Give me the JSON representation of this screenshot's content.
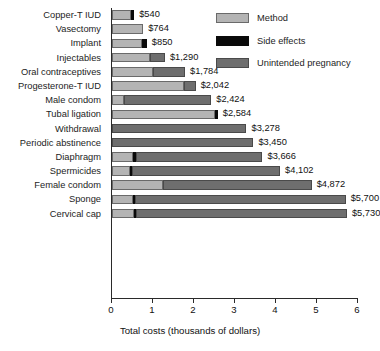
{
  "chart_data": {
    "type": "bar",
    "orientation": "horizontal",
    "stacked": true,
    "title": "",
    "xlabel": "Total costs (thousands of dollars)",
    "ylabel": "",
    "xlim": [
      0,
      6
    ],
    "xticks": [
      0,
      1,
      2,
      3,
      4,
      5,
      6
    ],
    "xtick_labels": [
      "0",
      "1",
      "2",
      "3",
      "4",
      "5",
      "6"
    ],
    "grid": false,
    "legend_position": "top-right",
    "units": "thousands of dollars",
    "categories": [
      "Copper-T IUD",
      "Vasectomy",
      "Implant",
      "Injectables",
      "Oral contraceptives",
      "Progesterone-T IUD",
      "Male condom",
      "Tubal ligation",
      "Withdrawal",
      "Periodic abstinence",
      "Diaphragm",
      "Spermicides",
      "Female condom",
      "Sponge",
      "Cervical cap"
    ],
    "series": [
      {
        "name": "Method",
        "color": "#b4b4b4",
        "values": [
          0.47,
          0.76,
          0.72,
          0.92,
          1.0,
          1.75,
          0.3,
          2.52,
          0.0,
          0.0,
          0.52,
          0.44,
          1.25,
          0.5,
          0.53
        ]
      },
      {
        "name": "Side effects",
        "color": "#0a0a0a",
        "values": [
          0.07,
          0.0,
          0.13,
          0.0,
          0.0,
          0.0,
          0.0,
          0.06,
          0.0,
          0.0,
          0.06,
          0.06,
          0.0,
          0.06,
          0.06
        ]
      },
      {
        "name": "Unintended pregnancy",
        "color": "#6e6e6e",
        "values": [
          0.0,
          0.0,
          0.0,
          0.37,
          0.78,
          0.29,
          2.12,
          0.0,
          3.28,
          3.45,
          3.09,
          3.6,
          3.62,
          5.14,
          5.14
        ]
      }
    ],
    "totals": [
      0.54,
      0.764,
      0.85,
      1.29,
      1.784,
      2.042,
      2.424,
      2.584,
      3.278,
      3.45,
      3.666,
      4.102,
      4.872,
      5.7,
      5.73
    ],
    "value_labels": [
      "$540",
      "$764",
      "$850",
      "$1,290",
      "$1,784",
      "$2,042",
      "$2,424",
      "$2,584",
      "$3,278",
      "$3,450",
      "$3,666",
      "$4,102",
      "$4,872",
      "$5,700",
      "$5,730"
    ]
  },
  "legend": {
    "items": [
      {
        "label": "Method",
        "color": "#b4b4b4"
      },
      {
        "label": "Side effects",
        "color": "#0a0a0a"
      },
      {
        "label": "Unintended pregnancy",
        "color": "#6e6e6e"
      }
    ]
  }
}
